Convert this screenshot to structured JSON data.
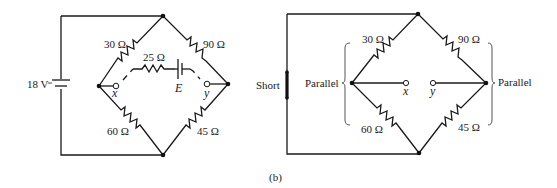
{
  "figure_label": "(b)",
  "left_circuit": {
    "source_label": "18 V",
    "r_top_left": "30 Ω",
    "r_top_right": "90 Ω",
    "r_bottom_left": "60 Ω",
    "r_bottom_right": "45 Ω",
    "r_thevenin": "25 Ω",
    "emf_label": "E",
    "terminal_x": "x",
    "terminal_y": "y"
  },
  "right_circuit": {
    "short_label": "Short",
    "parallel_left_label": "Parallel",
    "parallel_right_label": "Parallel",
    "r_top_left": "30 Ω",
    "r_top_right": "90 Ω",
    "r_bottom_left": "60 Ω",
    "r_bottom_right": "45 Ω",
    "terminal_x": "x",
    "terminal_y": "y"
  }
}
